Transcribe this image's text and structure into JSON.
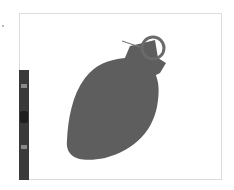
{
  "canvas": {
    "background": "#ffffff",
    "border_color": "#dcdcdc"
  },
  "toolbar": {
    "color": "#3a3a3a",
    "buttons": [
      "tool-1",
      "tool-2",
      "tool-3"
    ]
  },
  "figure": {
    "fill": "#5e5e5e",
    "ring_stroke": "#6a6a6a",
    "needle_color": "#7a7a7a"
  }
}
